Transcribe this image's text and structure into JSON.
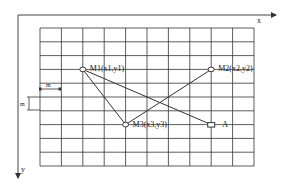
{
  "diagram": {
    "axes": {
      "x_label": "x",
      "y_label": "y"
    },
    "grid": {
      "columns": 10,
      "rows": 10,
      "left": 40,
      "top": 28,
      "right": 254,
      "bottom": 166,
      "cell_label_width": "m",
      "cell_label_height": "m"
    },
    "points": [
      {
        "id": "M1",
        "label": "M1(x1,y1)",
        "shape": "circle",
        "col": 2,
        "row": 3
      },
      {
        "id": "M2",
        "label": "M2(x2,y2)",
        "shape": "circle",
        "col": 8,
        "row": 3
      },
      {
        "id": "M3",
        "label": "M3(x3,y3)",
        "shape": "circle",
        "col": 4,
        "row": 7
      },
      {
        "id": "A",
        "label": "A",
        "shape": "square",
        "col": 8,
        "row": 7
      }
    ],
    "lines": [
      [
        "M1",
        "M3"
      ],
      [
        "M1",
        "A"
      ],
      [
        "M2",
        "M3"
      ]
    ],
    "colors": {
      "line": "#222222",
      "grid": "#333333",
      "background": "#ffffff"
    }
  }
}
